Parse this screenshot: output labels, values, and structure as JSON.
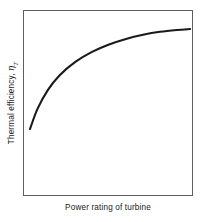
{
  "figure": {
    "background_color": "#ffffff",
    "frame_color": "#5f5f5f",
    "curve_color": "#1a1a1a",
    "text_color": "#1a1a1a"
  },
  "axes": {
    "x_label": "Power rating of turbine",
    "y_label_text": "Thermal efficiency, ",
    "y_label_symbol": "η",
    "y_label_subscript": "T"
  },
  "chart_data": {
    "type": "line",
    "title": "",
    "xlabel": "Power rating of turbine",
    "ylabel": "Thermal efficiency, η_T",
    "xlim": [
      0,
      1
    ],
    "ylim": [
      0,
      1
    ],
    "grid": false,
    "legend": "none",
    "axis_ticks": {
      "x": [],
      "y": []
    },
    "annotations": [],
    "series": [
      {
        "name": "Thermal efficiency vs power rating",
        "x": [
          0.035,
          0.08,
          0.14,
          0.21,
          0.3,
          0.4,
          0.5,
          0.6,
          0.7,
          0.8,
          0.9,
          0.977
        ],
        "y": [
          0.365,
          0.475,
          0.575,
          0.655,
          0.725,
          0.78,
          0.82,
          0.85,
          0.872,
          0.888,
          0.898,
          0.903
        ]
      }
    ]
  }
}
